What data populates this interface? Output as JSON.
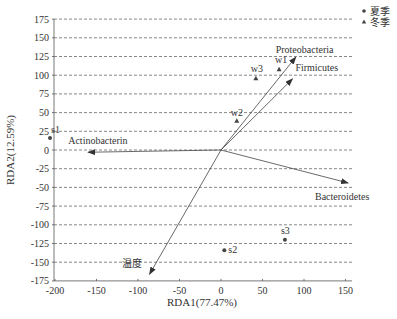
{
  "chart_data": {
    "type": "scatter",
    "subtype": "RDA biplot",
    "title": "",
    "xlabel": "RDA1(77.47%)",
    "ylabel": "RDA2(12.59%)",
    "xlim": [
      -210,
      150
    ],
    "ylim": [
      -175,
      175
    ],
    "xticks": [
      -200,
      -150,
      -100,
      -50,
      0,
      50,
      100,
      150
    ],
    "yticks": [
      175,
      150,
      125,
      100,
      75,
      50,
      25,
      0,
      -25,
      -50,
      -75,
      -100,
      -125,
      -150,
      -175
    ],
    "grid": {
      "horizontal_dashed": true,
      "vertical": false
    },
    "legend": {
      "position": "top-right",
      "entries": [
        {
          "label": "夏季",
          "marker": "circle"
        },
        {
          "label": "冬季",
          "marker": "triangle"
        }
      ]
    },
    "series": [
      {
        "name": "夏季",
        "marker": "circle",
        "points": [
          {
            "label": "s1",
            "x": -206,
            "y": 16
          },
          {
            "label": "s2",
            "x": 4,
            "y": -134
          },
          {
            "label": "s3",
            "x": 77,
            "y": -120
          }
        ]
      },
      {
        "name": "冬季",
        "marker": "triangle",
        "points": [
          {
            "label": "w1",
            "x": 70,
            "y": 108
          },
          {
            "label": "w2",
            "x": 19,
            "y": 39
          },
          {
            "label": "w3",
            "x": 42,
            "y": 96
          }
        ]
      }
    ],
    "vectors": [
      {
        "label": "Proteobacteria",
        "x": 90,
        "y": 124
      },
      {
        "label": "Firmicutes",
        "x": 86,
        "y": 95
      },
      {
        "label": "Bacteroidetes",
        "x": 153,
        "y": -44
      },
      {
        "label": "Actinobacterin",
        "x": -160,
        "y": -3
      },
      {
        "label": "温度",
        "x": -86,
        "y": -166
      }
    ]
  }
}
